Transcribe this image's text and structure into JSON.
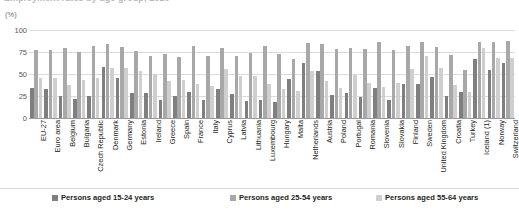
{
  "header": {
    "cut_off_title": "Employment rates by age group, 2010",
    "unit": "(%)"
  },
  "legend": {
    "position": "bottom",
    "items": [
      {
        "label": "Persons aged 15-24 years",
        "color": "#7f7f7f"
      },
      {
        "label": "Persons aged 25-54 years",
        "color": "#a8a8a8"
      },
      {
        "label": "Persons aged 55-64 years",
        "color": "#cfcfcf"
      }
    ]
  },
  "chart_data": {
    "type": "bar",
    "title": "Employment rates by age group, 2010",
    "subtitle": "",
    "xlabel": "",
    "ylabel": "(%)",
    "ylim": [
      0,
      100
    ],
    "yticks": [
      100,
      75,
      50,
      25,
      0
    ],
    "grid": true,
    "legend_position": "bottom",
    "categories": [
      "EU-27",
      "Euro area",
      "Belgium",
      "Bulgaria",
      "Czech Republic",
      "Denmark",
      "Germany",
      "Estonia",
      "Ireland",
      "Greece",
      "Spain",
      "France",
      "Italy",
      "Cyprus",
      "Latvia",
      "Lithuania",
      "Luxembourg",
      "Hungary",
      "Malta",
      "Netherlands",
      "Austria",
      "Poland",
      "Portugal",
      "Romania",
      "Slovenia",
      "Slovakia",
      "Finland",
      "Sweden",
      "United Kingdom",
      "Croatia",
      "Turkey",
      "Iceland (1)",
      "Norway",
      "Switzerland"
    ],
    "series": [
      {
        "name": "Persons aged 15-24 years",
        "color": "#7f7f7f",
        "values": [
          34,
          33,
          25,
          22,
          25,
          58,
          46,
          28,
          28,
          20,
          25,
          30,
          21,
          33,
          27,
          19,
          21,
          18,
          44,
          63,
          53,
          26,
          28,
          24,
          34,
          20,
          39,
          39,
          47,
          25,
          30,
          67,
          54,
          62
        ]
      },
      {
        "name": "Persons aged 25-54 years",
        "color": "#a8a8a8",
        "values": [
          77,
          77,
          79,
          75,
          82,
          84,
          81,
          76,
          71,
          73,
          69,
          82,
          71,
          80,
          71,
          74,
          82,
          73,
          67,
          85,
          84,
          78,
          80,
          78,
          86,
          77,
          82,
          86,
          81,
          72,
          55,
          86,
          86,
          88
        ]
      },
      {
        "name": "Persons aged 55-64 years",
        "color": "#cfcfcf",
        "values": [
          46,
          45,
          37,
          43,
          46,
          57,
          57,
          53,
          50,
          42,
          43,
          39,
          36,
          56,
          48,
          48,
          39,
          33,
          31,
          53,
          42,
          34,
          49,
          40,
          35,
          40,
          56,
          70,
          57,
          38,
          29,
          80,
          68,
          68
        ]
      }
    ]
  }
}
